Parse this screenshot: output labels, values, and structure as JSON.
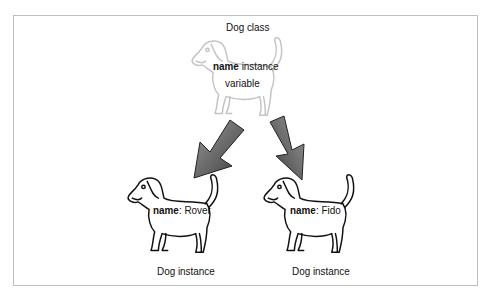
{
  "diagram": {
    "class_node": {
      "title": "Dog class",
      "field_name": "name",
      "field_desc_line1": "instance",
      "field_desc_line2": "variable",
      "icon": "dog-outline-icon",
      "outline_color": "#c4c4c4"
    },
    "instances": [
      {
        "caption": "Dog instance",
        "field_name": "name",
        "separator": ":",
        "field_value": "Rover",
        "icon": "dog-icon"
      },
      {
        "caption": "Dog instance",
        "field_name": "name",
        "separator": ":",
        "field_value": "Fido",
        "icon": "dog-icon"
      }
    ],
    "arrows": [
      {
        "from": "class_node",
        "to": "instances.0",
        "icon": "arrow-down-left-icon"
      },
      {
        "from": "class_node",
        "to": "instances.1",
        "icon": "arrow-down-right-icon"
      }
    ],
    "colors": {
      "arrow_dark": "#4a4a4a",
      "arrow_light": "#9a9a9a",
      "frame_border": "#bdbdbd",
      "line": "#111111"
    }
  }
}
